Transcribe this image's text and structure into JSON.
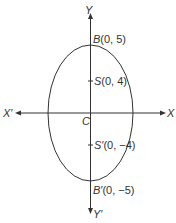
{
  "diagram": {
    "type": "ellipse",
    "axes": {
      "x_positive": "X",
      "x_negative": "X′",
      "y_positive": "Y",
      "y_negative": "Y′",
      "origin": "C"
    },
    "points": [
      {
        "id": "B",
        "letter": "B",
        "coords": "(0, 5)"
      },
      {
        "id": "S",
        "letter": "S",
        "coords": "(0, 4)"
      },
      {
        "id": "S_prime",
        "letter": "S′",
        "coords": "(0, −4)"
      },
      {
        "id": "B_prime",
        "letter": "B′",
        "coords": "(0, −5)"
      }
    ],
    "colors": {
      "stroke": "#333333",
      "background": "#ffffff"
    }
  }
}
